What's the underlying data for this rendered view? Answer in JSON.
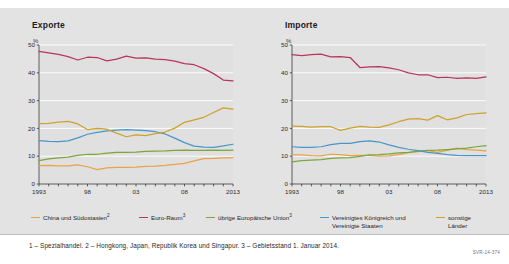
{
  "panels": [
    {
      "title": "Exporte",
      "unit": "%"
    },
    {
      "title": "Importe",
      "unit": "%"
    }
  ],
  "legend": {
    "items": [
      {
        "label": "China und Südostasien",
        "sup": "2",
        "color": "#e8a24a",
        "line2": ""
      },
      {
        "label": "Euro-Raum",
        "sup": "3",
        "color": "#b8355c",
        "line2": ""
      },
      {
        "label": "übrige Europäische Union",
        "sup": "3",
        "color": "#7aa63c",
        "line2": ""
      },
      {
        "label": "Vereinigtes Königreich und",
        "sup": "",
        "color": "#4a95c9",
        "line2": "Vereinigte Staaten"
      },
      {
        "label": "sonstige",
        "sup": "",
        "color": "#cfa12c",
        "line2": "Länder"
      }
    ]
  },
  "footnote": {
    "text": "1 – Spezialhandel.  2 – Hongkong, Japan, Republik Korea und Singapur.  3 – Gebietsstand 1. Januar 2014.",
    "source_code": "SVR-14-374"
  },
  "chart_data": [
    {
      "type": "line",
      "title": "Exporte",
      "xlabel": "",
      "ylabel": "%",
      "ylim": [
        0,
        50
      ],
      "xlim": [
        1993,
        2013
      ],
      "yticks": [
        0,
        10,
        20,
        30,
        40,
        50
      ],
      "xticks": [
        1993,
        1994,
        1995,
        1996,
        1997,
        1998,
        1999,
        2000,
        2001,
        2002,
        2003,
        2004,
        2005,
        2006,
        2007,
        2008,
        2009,
        2010,
        2011,
        2012,
        2013
      ],
      "xticklabels": {
        "1993": "1993",
        "1998": "98",
        "2003": "03",
        "2008": "08",
        "2013": "2013"
      },
      "grid": true,
      "legend_position": "bottom",
      "x": [
        1993,
        1994,
        1995,
        1996,
        1997,
        1998,
        1999,
        2000,
        2001,
        2002,
        2003,
        2004,
        2005,
        2006,
        2007,
        2008,
        2009,
        2010,
        2011,
        2012,
        2013
      ],
      "series": [
        {
          "name": "China und Südostasien",
          "color": "#e8a24a",
          "values": [
            6.6,
            6.7,
            6.5,
            6.5,
            6.9,
            6.2,
            5.2,
            5.8,
            6.0,
            6.0,
            6.1,
            6.3,
            6.4,
            6.7,
            7.1,
            7.4,
            8.3,
            9.1,
            9.2,
            9.4,
            9.5
          ]
        },
        {
          "name": "Euro-Raum",
          "color": "#b8355c",
          "values": [
            47.7,
            47.2,
            46.6,
            45.8,
            44.6,
            45.6,
            45.5,
            44.3,
            44.9,
            46.0,
            45.3,
            45.4,
            44.9,
            44.7,
            44.2,
            43.3,
            42.9,
            41.5,
            39.7,
            37.4,
            37.1
          ]
        },
        {
          "name": "übrige Europäische Union",
          "color": "#7aa63c",
          "values": [
            8.4,
            9.0,
            9.4,
            9.7,
            10.3,
            10.7,
            10.7,
            11.1,
            11.4,
            11.4,
            11.5,
            11.7,
            11.8,
            11.9,
            12.1,
            12.2,
            12.1,
            12.1,
            12.2,
            12.1,
            12.2
          ]
        },
        {
          "name": "Vereinigtes Königreich und Vereinigte Staaten",
          "color": "#4a95c9",
          "values": [
            15.6,
            15.3,
            15.2,
            15.5,
            16.6,
            17.9,
            18.6,
            19.1,
            19.4,
            19.6,
            19.4,
            19.2,
            18.8,
            18.0,
            16.5,
            14.9,
            13.6,
            13.3,
            13.2,
            13.7,
            14.3
          ]
        },
        {
          "name": "sonstige Länder",
          "color": "#cfa12c",
          "values": [
            21.7,
            21.8,
            22.3,
            22.5,
            21.6,
            19.6,
            20.0,
            19.7,
            18.3,
            17.0,
            17.7,
            17.4,
            18.1,
            18.7,
            20.1,
            22.2,
            23.1,
            24.0,
            25.7,
            27.4,
            26.9
          ]
        }
      ]
    },
    {
      "type": "line",
      "title": "Importe",
      "xlabel": "",
      "ylabel": "%",
      "ylim": [
        0,
        50
      ],
      "xlim": [
        1993,
        2013
      ],
      "yticks": [
        0,
        10,
        20,
        30,
        40,
        50
      ],
      "xticks": [
        1993,
        1994,
        1995,
        1996,
        1997,
        1998,
        1999,
        2000,
        2001,
        2002,
        2003,
        2004,
        2005,
        2006,
        2007,
        2008,
        2009,
        2010,
        2011,
        2012,
        2013
      ],
      "xticklabels": {
        "1993": "1993",
        "1998": "98",
        "2003": "03",
        "2008": "08",
        "2013": "2013"
      },
      "grid": true,
      "legend_position": "bottom",
      "x": [
        1993,
        1994,
        1995,
        1996,
        1997,
        1998,
        1999,
        2000,
        2001,
        2002,
        2003,
        2004,
        2005,
        2006,
        2007,
        2008,
        2009,
        2010,
        2011,
        2012,
        2013
      ],
      "series": [
        {
          "name": "China und Südostasien",
          "color": "#e8a24a",
          "values": [
            10.5,
            10.5,
            10.2,
            10.1,
            10.7,
            10.6,
            10.2,
            10.3,
            10.3,
            10.0,
            10.1,
            10.6,
            11.3,
            11.6,
            12.0,
            11.4,
            12.1,
            12.9,
            12.4,
            12.2,
            11.9
          ]
        },
        {
          "name": "Euro-Raum",
          "color": "#b8355c",
          "values": [
            46.5,
            46.2,
            46.5,
            46.7,
            45.7,
            45.8,
            45.5,
            41.9,
            42.1,
            42.2,
            41.8,
            41.1,
            40.0,
            39.3,
            39.3,
            38.3,
            38.4,
            38.0,
            38.2,
            38.0,
            38.5
          ]
        },
        {
          "name": "übrige Europäische Union",
          "color": "#7aa63c",
          "values": [
            8.0,
            8.4,
            8.6,
            8.8,
            9.2,
            9.4,
            9.5,
            9.9,
            10.5,
            10.6,
            10.8,
            11.2,
            11.4,
            11.8,
            12.1,
            12.2,
            12.4,
            12.6,
            12.9,
            13.4,
            13.8
          ]
        },
        {
          "name": "Vereinigtes Königreich und Vereinigte Staaten",
          "color": "#4a95c9",
          "values": [
            13.4,
            13.2,
            13.2,
            13.4,
            14.2,
            14.6,
            14.6,
            15.2,
            15.5,
            15.1,
            14.1,
            13.2,
            12.5,
            12.0,
            11.4,
            11.0,
            10.6,
            10.3,
            10.2,
            10.2,
            10.2
          ]
        },
        {
          "name": "sonstige Länder",
          "color": "#cfa12c",
          "values": [
            20.8,
            20.7,
            20.5,
            20.6,
            20.6,
            19.3,
            20.1,
            20.7,
            20.5,
            20.4,
            21.3,
            22.4,
            23.3,
            23.5,
            23.0,
            24.6,
            23.1,
            23.8,
            25.0,
            25.3,
            25.6
          ]
        }
      ]
    }
  ]
}
